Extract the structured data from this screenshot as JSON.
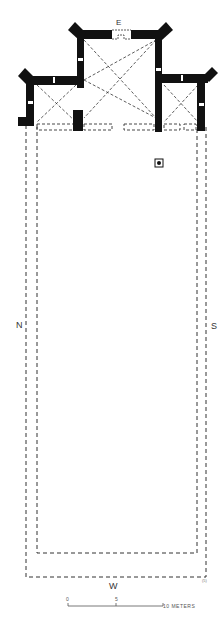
{
  "diagram": {
    "type": "architectural floor plan",
    "colors": {
      "wall": "#111111",
      "dashed": "#333333",
      "background": "#ffffff"
    }
  },
  "labels": {
    "east": "E",
    "north": "N",
    "south": "S",
    "west": "W",
    "figure_mark": "(5)"
  },
  "scale_bar": {
    "ticks": [
      "0",
      "5",
      "10 METERS"
    ],
    "unit": "METERS"
  },
  "features": [
    {
      "name": "chancel",
      "description": "central square tower with diagonal vault lines"
    },
    {
      "name": "north-chapel",
      "description": "left side chapel with diagonal vault lines"
    },
    {
      "name": "south-chapel",
      "description": "right side chapel with diagonal vault lines"
    },
    {
      "name": "nave",
      "description": "long rectangle outlined in dashed lines"
    },
    {
      "name": "altar-marker",
      "description": "small square with dot"
    }
  ]
}
